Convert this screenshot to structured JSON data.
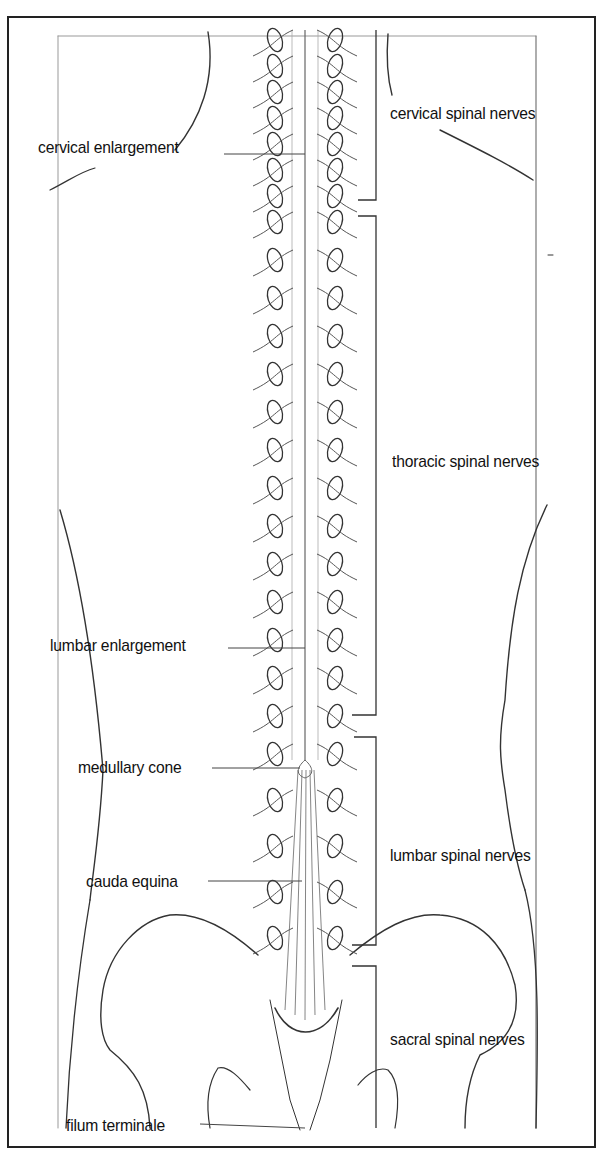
{
  "diagram": {
    "left_labels": [
      {
        "id": "cervical-enlargement",
        "text": "cervical enlargement",
        "x": 38,
        "y": 138,
        "leader_to": [
          305,
          154
        ]
      },
      {
        "id": "lumbar-enlargement",
        "text": "lumbar enlargement",
        "x": 50,
        "y": 636,
        "leader_to": [
          305,
          648
        ]
      },
      {
        "id": "medullary-cone",
        "text": "medullary cone",
        "x": 78,
        "y": 758,
        "leader_to": [
          300,
          768
        ]
      },
      {
        "id": "cauda-equina",
        "text": "cauda equina",
        "x": 86,
        "y": 872,
        "leader_to": [
          302,
          881
        ]
      },
      {
        "id": "filum-terminale",
        "text": "filum terminale",
        "x": 66,
        "y": 1116,
        "leader_to": [
          305,
          1128
        ]
      }
    ],
    "right_labels": [
      {
        "id": "cervical-spinal-nerves",
        "text": "cervical spinal nerves",
        "x": 390,
        "y": 104
      },
      {
        "id": "thoracic-spinal-nerves",
        "text": "thoracic spinal nerves",
        "x": 392,
        "y": 452
      },
      {
        "id": "lumbar-spinal-nerves",
        "text": "lumbar spinal nerves",
        "x": 390,
        "y": 846
      },
      {
        "id": "sacral-spinal-nerves",
        "text": "sacral spinal nerves",
        "x": 390,
        "y": 1030
      }
    ],
    "brackets": [
      {
        "group": "cervical",
        "y_start": 30,
        "y_end": 200
      },
      {
        "group": "thoracic",
        "y_start": 216,
        "y_end": 715
      },
      {
        "group": "lumbar",
        "y_start": 737,
        "y_end": 945
      },
      {
        "group": "sacral",
        "y_start": 966,
        "y_end": 1128
      }
    ]
  }
}
